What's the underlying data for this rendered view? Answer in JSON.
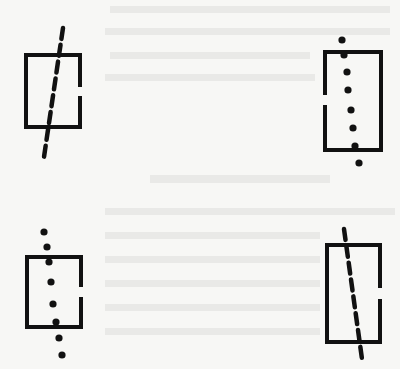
{
  "figure": {
    "width": 400,
    "height": 369,
    "background": "#f7f7f5",
    "ink": "#111111",
    "stroke_width": 4,
    "panels": [
      {
        "id": "top-left",
        "box": {
          "x": 26,
          "y": 55,
          "w": 54,
          "h": 72
        },
        "gap": {
          "side": "right",
          "from": 87,
          "to": 96
        },
        "axis": {
          "style": "dashed",
          "x1": 63,
          "y1": 28,
          "x2": 44,
          "y2": 157
        }
      },
      {
        "id": "top-right",
        "box": {
          "x": 325,
          "y": 52,
          "w": 56,
          "h": 98
        },
        "gap": {
          "side": "left",
          "from": 95,
          "to": 105
        },
        "axis": {
          "style": "dotted",
          "points": [
            [
              342,
              40
            ],
            [
              344,
              55
            ],
            [
              347,
              72
            ],
            [
              348,
              90
            ],
            [
              351,
              110
            ],
            [
              353,
              128
            ],
            [
              355,
              146
            ],
            [
              359,
              163
            ]
          ]
        }
      },
      {
        "id": "bottom-left",
        "box": {
          "x": 27,
          "y": 257,
          "w": 54,
          "h": 70
        },
        "gap": {
          "side": "right",
          "from": 287,
          "to": 297
        },
        "axis": {
          "style": "dotted",
          "points": [
            [
              44,
              232
            ],
            [
              47,
              247
            ],
            [
              49,
              262
            ],
            [
              51,
              282
            ],
            [
              53,
              304
            ],
            [
              56,
              322
            ],
            [
              59,
              338
            ],
            [
              62,
              355
            ]
          ]
        }
      },
      {
        "id": "bottom-right",
        "box": {
          "x": 327,
          "y": 245,
          "w": 53,
          "h": 97
        },
        "gap": {
          "side": "right",
          "from": 288,
          "to": 299
        },
        "axis": {
          "style": "dashed",
          "x1": 344,
          "y1": 229,
          "x2": 362,
          "y2": 359
        }
      }
    ]
  }
}
